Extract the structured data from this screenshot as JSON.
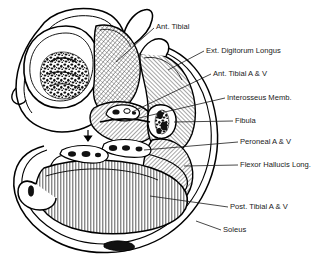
{
  "figure": {
    "type": "anatomical-cross-section",
    "background_color": "#ffffff",
    "line_color": "#000000",
    "label_color": "#1a1a1a"
  },
  "labels": [
    {
      "id": "ant-tibial",
      "text": "Ant. Tibial",
      "x": 156,
      "y": 27,
      "anchor": "start"
    },
    {
      "id": "ext-digitorum-longus",
      "text": "Ext. Digitorum Longus",
      "x": 206,
      "y": 51,
      "anchor": "start"
    },
    {
      "id": "ant-tibial-a-v",
      "text": "Ant. Tibial A & V",
      "x": 213,
      "y": 74,
      "anchor": "start"
    },
    {
      "id": "interosseus-memb",
      "text": "Interosseus Memb.",
      "x": 227,
      "y": 98,
      "anchor": "start"
    },
    {
      "id": "fibula",
      "text": "Fibula",
      "x": 235,
      "y": 121,
      "anchor": "start"
    },
    {
      "id": "peroneal-a-v",
      "text": "Peroneal A & V",
      "x": 240,
      "y": 142,
      "anchor": "start"
    },
    {
      "id": "flexor-hallucis-long",
      "text": "Flexor Hallucis Long.",
      "x": 240,
      "y": 165,
      "anchor": "start"
    },
    {
      "id": "post-tibial-a-v",
      "text": "Post. Tibial A & V",
      "x": 230,
      "y": 207,
      "anchor": "start"
    },
    {
      "id": "soleus",
      "text": "Soleus",
      "x": 223,
      "y": 230,
      "anchor": "start"
    }
  ],
  "structures": [
    {
      "id": "tibia",
      "name": "Tibia (bone, cross-section with marrow)"
    },
    {
      "id": "anterior-tibial-muscle",
      "name": "Anterior tibial muscle"
    },
    {
      "id": "ext-digitorum-muscle",
      "name": "Extensor digitorum longus muscle"
    },
    {
      "id": "fibula-bone",
      "name": "Fibula (bone, cross-section with marrow)"
    },
    {
      "id": "interosseous-membrane",
      "name": "Interosseous membrane"
    },
    {
      "id": "soleus-muscle",
      "name": "Soleus muscle"
    },
    {
      "id": "flexor-hallucis-muscle",
      "name": "Flexor hallucis longus muscle"
    },
    {
      "id": "skin-fascia",
      "name": "Skin and fascia envelope"
    },
    {
      "id": "vessel-bundles",
      "name": "Neurovascular bundles"
    }
  ]
}
